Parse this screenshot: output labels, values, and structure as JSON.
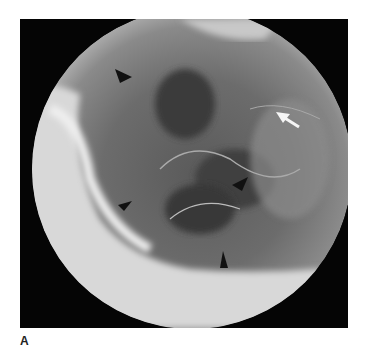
{
  "figure": {
    "panel_label": "A",
    "annotations": [
      {
        "type": "arrowhead",
        "color": "black",
        "x": 125,
        "y": 73
      },
      {
        "type": "arrowhead",
        "color": "black",
        "x": 242,
        "y": 185
      },
      {
        "type": "arrowhead",
        "color": "black",
        "x": 220,
        "y": 268
      },
      {
        "type": "arrowhead",
        "color": "black",
        "x": 122,
        "y": 205
      },
      {
        "type": "arrow",
        "color": "white",
        "x": 290,
        "y": 120
      }
    ]
  }
}
